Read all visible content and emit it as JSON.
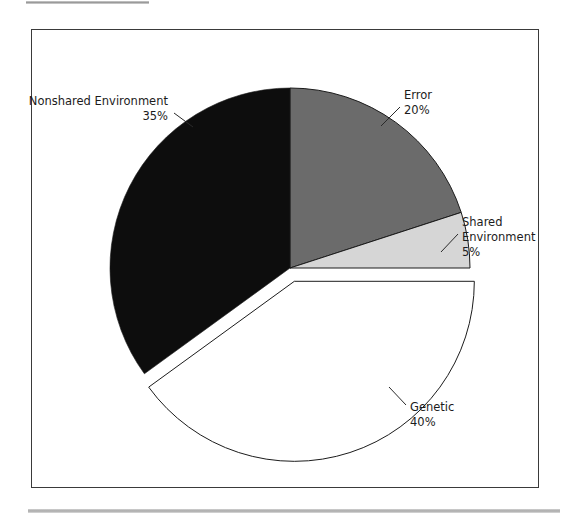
{
  "figure": {
    "frame": {
      "x": 31,
      "y": 29,
      "width": 508,
      "height": 459,
      "border_color": "#3a3a3a",
      "background": "#ffffff"
    },
    "decorations": {
      "top_rule_color": "#b9b9b9",
      "bottom_rule_color": "#b9b9b9"
    }
  },
  "chart_data": {
    "type": "pie",
    "title": "",
    "subtitle": "",
    "xlabel": "",
    "ylabel": "",
    "grid": false,
    "legend_position": "none",
    "label_format": "name_and_percent",
    "start_angle_deg": 0,
    "direction": "clockwise",
    "center": {
      "x": 290,
      "y": 268
    },
    "radius": 180,
    "categories": [
      "Error",
      "Shared Environment",
      "Genetic",
      "Nonshared Environment"
    ],
    "values": [
      20,
      5,
      40,
      35
    ],
    "units": "%",
    "total": 100,
    "slices": [
      {
        "name": "Error",
        "value": 20,
        "value_text": "20%",
        "color": "#6b6b6b",
        "exploded": false,
        "start_angle_deg": 0,
        "end_angle_deg": 72,
        "label_lines": [
          "Error",
          "20%"
        ],
        "label_x": 404,
        "label_y": 99,
        "label_anchor": "start",
        "leader": {
          "x1": 400,
          "y1": 107,
          "x2": 381,
          "y2": 126
        }
      },
      {
        "name": "Shared Environment",
        "value": 5,
        "value_text": "5%",
        "color": "#d6d6d6",
        "exploded": false,
        "start_angle_deg": 72,
        "end_angle_deg": 90,
        "label_lines": [
          "Shared",
          "Environment",
          "5%"
        ],
        "label_x": 462,
        "label_y": 226,
        "label_anchor": "start",
        "leader": {
          "x1": 458,
          "y1": 234,
          "x2": 441,
          "y2": 252
        }
      },
      {
        "name": "Genetic",
        "value": 40,
        "value_text": "40%",
        "color": "#ffffff",
        "exploded": true,
        "explode_offset": 14,
        "start_angle_deg": 90,
        "end_angle_deg": 234,
        "label_lines": [
          "Genetic",
          "40%"
        ],
        "label_x": 410,
        "label_y": 411,
        "label_anchor": "start",
        "leader": {
          "x1": 406,
          "y1": 405,
          "x2": 389,
          "y2": 387
        }
      },
      {
        "name": "Nonshared Environment",
        "value": 35,
        "value_text": "35%",
        "color": "#0d0d0d",
        "exploded": false,
        "start_angle_deg": 234,
        "end_angle_deg": 360,
        "label_lines": [
          "Nonshared Environment",
          "35%"
        ],
        "label_x": 168,
        "label_y": 105,
        "label_anchor": "end",
        "leader": {
          "x1": 174,
          "y1": 113,
          "x2": 193,
          "y2": 127
        }
      }
    ],
    "slice_stroke": "#1c1c1c",
    "slice_gap": true
  }
}
